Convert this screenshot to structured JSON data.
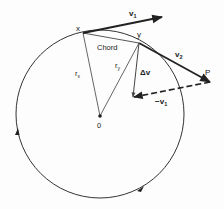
{
  "diagram": {
    "title": "",
    "labels": {
      "point_x": "x",
      "point_y": "y",
      "point_p": "P",
      "center": "0",
      "chord": "Chord",
      "v1": "v",
      "v1_sub": "1",
      "v2": "v",
      "v2_sub": "2",
      "delta_v": "Δv",
      "neg_v1": "−v",
      "neg_v1_sub": "1",
      "r_x": "r",
      "r_x_sub": "x",
      "r_y": "r",
      "r_y_sub": "y"
    },
    "colors": {
      "stroke": "#222222",
      "radius_stroke": "#555555",
      "background": "#fdfdfd"
    },
    "motion_direction": "counter-clockwise"
  }
}
